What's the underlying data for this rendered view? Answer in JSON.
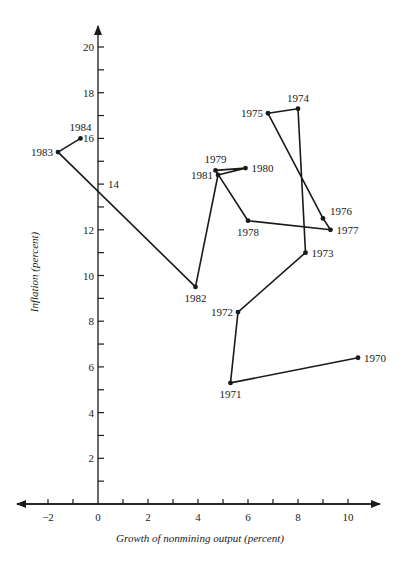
{
  "chart_data": {
    "type": "line",
    "title": "",
    "xlabel": "Growth of nonmining output (percent)",
    "ylabel": "Inflation (percent)",
    "xlim": [
      -2.8,
      11.5
    ],
    "ylim": [
      0,
      20.8
    ],
    "grid": false,
    "legend": null,
    "x_ticks": [
      -2,
      -1,
      0,
      1,
      2,
      3,
      4,
      5,
      6,
      7,
      8,
      9,
      10
    ],
    "x_tick_labels": [
      {
        "value": -2,
        "label": "−2"
      },
      {
        "value": 0,
        "label": "0"
      },
      {
        "value": 2,
        "label": "2"
      },
      {
        "value": 4,
        "label": "4"
      },
      {
        "value": 6,
        "label": "6"
      },
      {
        "value": 8,
        "label": "8"
      },
      {
        "value": 10,
        "label": "10"
      }
    ],
    "y_ticks": [
      1,
      2,
      3,
      4,
      5,
      6,
      7,
      8,
      9,
      10,
      11,
      12,
      13,
      14,
      15,
      16,
      17,
      18,
      19,
      20
    ],
    "y_tick_labels": [
      {
        "value": 2,
        "label": "2",
        "side": "left"
      },
      {
        "value": 4,
        "label": "4",
        "side": "left"
      },
      {
        "value": 6,
        "label": "6",
        "side": "left"
      },
      {
        "value": 8,
        "label": "8",
        "side": "left"
      },
      {
        "value": 10,
        "label": "10",
        "side": "left"
      },
      {
        "value": 12,
        "label": "12",
        "side": "left"
      },
      {
        "value": 14,
        "label": "14",
        "side": "right"
      },
      {
        "value": 16,
        "label": "16",
        "side": "left"
      },
      {
        "value": 18,
        "label": "18",
        "side": "left"
      },
      {
        "value": 20,
        "label": "20",
        "side": "left"
      }
    ],
    "series": [
      {
        "name": "Inflation vs. growth of nonmining output, 1970-1984",
        "points": [
          {
            "label": "1970",
            "x": 10.4,
            "y": 6.4,
            "label_pos": "right"
          },
          {
            "label": "1971",
            "x": 5.3,
            "y": 5.3,
            "label_pos": "below"
          },
          {
            "label": "1972",
            "x": 5.6,
            "y": 8.4,
            "label_pos": "left"
          },
          {
            "label": "1973",
            "x": 8.3,
            "y": 11.0,
            "label_pos": "right"
          },
          {
            "label": "1974",
            "x": 8.0,
            "y": 17.3,
            "label_pos": "above"
          },
          {
            "label": "1975",
            "x": 6.8,
            "y": 17.1,
            "label_pos": "left"
          },
          {
            "label": "1976",
            "x": 9.0,
            "y": 12.5,
            "label_pos": "right-up"
          },
          {
            "label": "1977",
            "x": 9.3,
            "y": 12.0,
            "label_pos": "right"
          },
          {
            "label": "1978",
            "x": 6.0,
            "y": 12.4,
            "label_pos": "below"
          },
          {
            "label": "1979",
            "x": 4.7,
            "y": 14.6,
            "label_pos": "above"
          },
          {
            "label": "1980",
            "x": 5.9,
            "y": 14.7,
            "label_pos": "right"
          },
          {
            "label": "1981",
            "x": 4.8,
            "y": 14.4,
            "label_pos": "left"
          },
          {
            "label": "1982",
            "x": 3.9,
            "y": 9.5,
            "label_pos": "below"
          },
          {
            "label": "1983",
            "x": -1.6,
            "y": 15.4,
            "label_pos": "left"
          },
          {
            "label": "1984",
            "x": -0.7,
            "y": 16.0,
            "label_pos": "above"
          }
        ]
      }
    ]
  }
}
